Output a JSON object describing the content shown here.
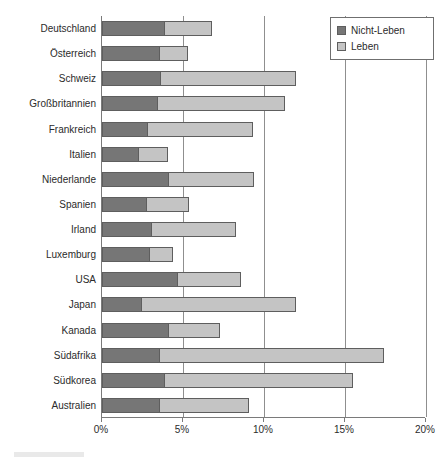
{
  "chart_data": {
    "type": "bar",
    "orientation": "horizontal",
    "stacked": true,
    "title": "",
    "subtitle": "",
    "xlabel": "",
    "ylabel": "",
    "xlim": [
      0,
      20
    ],
    "xticks": [
      0,
      5,
      10,
      15,
      20
    ],
    "xtick_labels": [
      "0%",
      "5%",
      "10%",
      "15%",
      "20%"
    ],
    "grid": true,
    "grid_axis": "x",
    "legend_position": "top-right",
    "value_unit": "%",
    "categories": [
      "Deutschland",
      "Österreich",
      "Schweiz",
      "Großbritannien",
      "Frankreich",
      "Italien",
      "Niederlande",
      "Spanien",
      "Irland",
      "Luxemburg",
      "USA",
      "Japan",
      "Kanada",
      "Südafrika",
      "Südkorea",
      "Australien"
    ],
    "series": [
      {
        "name": "Nicht-Leben",
        "color": "#767676",
        "values": [
          3.8,
          3.5,
          3.6,
          3.4,
          2.8,
          2.2,
          4.1,
          2.7,
          3.0,
          2.9,
          4.6,
          2.4,
          4.1,
          3.5,
          3.8,
          3.5
        ]
      },
      {
        "name": "Leben",
        "color": "#c4c4c4",
        "values": [
          3.0,
          1.8,
          8.4,
          7.9,
          6.5,
          1.9,
          5.3,
          2.7,
          5.3,
          1.5,
          4.0,
          9.6,
          3.2,
          13.9,
          11.7,
          5.6
        ]
      }
    ],
    "totals": [
      6.8,
      5.3,
      12.0,
      11.3,
      9.3,
      4.1,
      9.4,
      5.4,
      8.3,
      4.4,
      8.6,
      12.0,
      7.3,
      17.4,
      15.5,
      9.1
    ]
  },
  "legend": {
    "items": [
      {
        "label": "Nicht-Leben",
        "swatch": "series-swatch-nicht-leben"
      },
      {
        "label": "Leben",
        "swatch": "series-swatch-leben"
      }
    ]
  }
}
